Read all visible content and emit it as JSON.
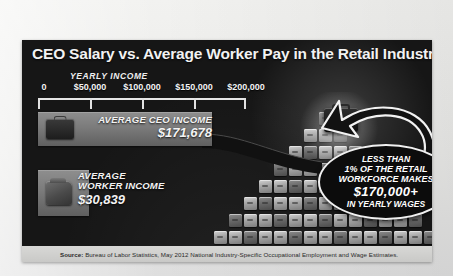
{
  "page": {
    "background_color": "#ececeb",
    "panel_color": "#161616"
  },
  "header": {
    "title": "CEO Salary vs. Average Worker Pay in the Retail Industry"
  },
  "axis": {
    "label": "YEARLY INCOME",
    "ticks": [
      {
        "label": "0",
        "value": 0
      },
      {
        "label": "$50,000",
        "value": 50000
      },
      {
        "label": "$100,000",
        "value": 100000
      },
      {
        "label": "$150,000",
        "value": 150000
      },
      {
        "label": "$200,000",
        "value": 200000
      }
    ]
  },
  "bars": {
    "ceo": {
      "label": "AVERAGE CEO INCOME",
      "value_label": "$171,678",
      "value": 171678,
      "icon": "briefcase-icon"
    },
    "worker": {
      "label_line1": "AVERAGE",
      "label_line2": "WORKER INCOME",
      "value_label": "$30,839",
      "value": 30839,
      "icon": "money-bag-icon"
    }
  },
  "callout": {
    "line1": "LESS THAN",
    "line2": "1% OF THE RETAIL",
    "line3": "WORKFORCE MAKES",
    "line4": "$170,000+",
    "line5": "IN YEARLY WAGES"
  },
  "footer": {
    "source_label": "Source:",
    "source_text": " Bureau of Labor Statistics, May 2012 National Industry-Specific Occupational Employment and Wage Estimates."
  },
  "chart_data": {
    "type": "bar",
    "title": "CEO Salary vs. Average Worker Pay in the Retail Industry",
    "orientation": "horizontal",
    "categories": [
      "AVERAGE CEO INCOME",
      "AVERAGE WORKER INCOME"
    ],
    "values": [
      171678,
      30839
    ],
    "value_labels": [
      "$171,678",
      "$30,839"
    ],
    "xlabel": "YEARLY INCOME",
    "ylabel": "",
    "xlim": [
      0,
      200000
    ],
    "xticks": [
      0,
      50000,
      100000,
      150000,
      200000
    ],
    "xtick_labels": [
      "0",
      "$50,000",
      "$100,000",
      "$150,000",
      "$200,000"
    ],
    "grid": false,
    "legend": false,
    "annotations": [
      "LESS THAN 1% OF THE RETAIL WORKFORCE MAKES $170,000+ IN YEARLY WAGES"
    ],
    "source": "Source: Bureau of Labor Statistics, May 2012 National Industry-Specific Occupational Employment and Wage Estimates."
  }
}
